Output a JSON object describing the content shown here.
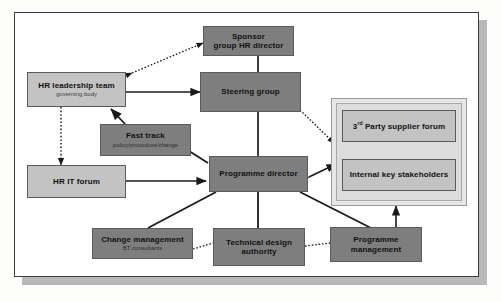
{
  "diagram": {
    "colors": {
      "node_light": "#c3c3c3",
      "node_dark": "#7e7e7e",
      "panel": "#e6e6e6",
      "border": "#5a5a5a",
      "frame_border": "#3a3a3a",
      "shadow": "#b8b8b8",
      "connector": "#1a1a1a"
    },
    "nodes": [
      {
        "id": "sponsor",
        "title": "Sponsor",
        "title2": "group HR director",
        "subtitle": "",
        "style": "dark"
      },
      {
        "id": "hr-leadership",
        "title": "HR leadership team",
        "title2": "",
        "subtitle": "governing body",
        "style": "light"
      },
      {
        "id": "steering",
        "title": "Steering group",
        "title2": "",
        "subtitle": "",
        "style": "dark"
      },
      {
        "id": "fast-track",
        "title": "Fast track",
        "title2": "",
        "subtitle": "policy/procedure/change",
        "style": "dark"
      },
      {
        "id": "hr-it-forum",
        "title": "HR IT forum",
        "title2": "",
        "subtitle": "",
        "style": "light"
      },
      {
        "id": "prog-director",
        "title": "Programme director",
        "title2": "",
        "subtitle": "",
        "style": "dark"
      },
      {
        "id": "third-party",
        "title_pre": "3",
        "title_sup": "rd",
        "title_post": " Party supplier forum",
        "subtitle": "",
        "style": "light"
      },
      {
        "id": "internal-key",
        "title": "Internal key stakeholders",
        "title2": "",
        "subtitle": "",
        "style": "light"
      },
      {
        "id": "change-mgmt",
        "title": "Change management",
        "title2": "",
        "subtitle": "BT consultants",
        "style": "dark"
      },
      {
        "id": "tech-design",
        "title": "Technical design",
        "title2": "authority",
        "subtitle": "",
        "style": "dark"
      },
      {
        "id": "prog-mgmt",
        "title": "Programme",
        "title2": "management",
        "subtitle": "",
        "style": "dark"
      }
    ],
    "connections": [
      {
        "from": "hr-leadership",
        "to": "sponsor",
        "line": "dotted",
        "arrows": "both"
      },
      {
        "from": "sponsor",
        "to": "steering",
        "line": "solid",
        "arrows": "none"
      },
      {
        "from": "hr-leadership",
        "to": "steering",
        "line": "solid",
        "arrows": "both"
      },
      {
        "from": "hr-leadership",
        "to": "hr-it-forum",
        "line": "dotted",
        "arrows": "both"
      },
      {
        "from": "fast-track",
        "to": "hr-leadership",
        "line": "solid",
        "arrows": "end"
      },
      {
        "from": "prog-director",
        "to": "fast-track",
        "line": "solid",
        "arrows": "end"
      },
      {
        "from": "steering",
        "to": "prog-director",
        "line": "solid",
        "arrows": "none"
      },
      {
        "from": "steering",
        "to": "third-party",
        "line": "dotted",
        "arrows": "both"
      },
      {
        "from": "hr-it-forum",
        "to": "prog-director",
        "line": "solid",
        "arrows": "both"
      },
      {
        "from": "prog-director",
        "to": "internal-key",
        "line": "solid",
        "arrows": "both"
      },
      {
        "from": "prog-director",
        "to": "change-mgmt",
        "line": "solid",
        "arrows": "none"
      },
      {
        "from": "prog-director",
        "to": "tech-design",
        "line": "solid",
        "arrows": "none"
      },
      {
        "from": "prog-director",
        "to": "prog-mgmt",
        "line": "solid",
        "arrows": "none"
      },
      {
        "from": "change-mgmt",
        "to": "tech-design",
        "line": "dotted",
        "arrows": "none"
      },
      {
        "from": "tech-design",
        "to": "prog-mgmt",
        "line": "dotted",
        "arrows": "none"
      },
      {
        "from": "prog-mgmt",
        "to": "internal-key",
        "line": "solid",
        "arrows": "both"
      }
    ]
  }
}
